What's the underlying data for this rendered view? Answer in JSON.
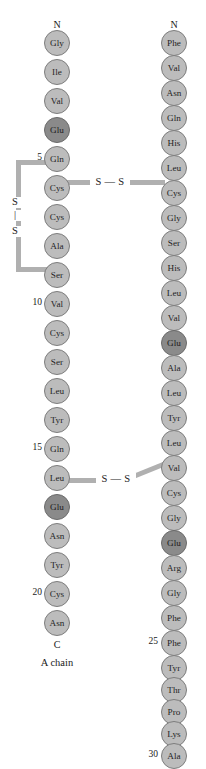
{
  "figure": {
    "colors": {
      "residue_fill": "#bcbcbc",
      "residue_fill_dark": "#8a8a8a",
      "residue_stroke": "#7d7d7d",
      "bond": "#b0b0b0",
      "text": "#1a1a1a",
      "background": "#ffffff"
    }
  },
  "chains": [
    {
      "id": "a-chain",
      "name": "A chain",
      "n_terminus_label": "N",
      "c_terminus_label": "C",
      "residues": [
        {
          "pos": 1,
          "label": "Gly",
          "shade": "light"
        },
        {
          "pos": 2,
          "label": "Ile",
          "shade": "light"
        },
        {
          "pos": 3,
          "label": "Val",
          "shade": "light"
        },
        {
          "pos": 4,
          "label": "Glu",
          "shade": "dark"
        },
        {
          "pos": 5,
          "label": "Gln",
          "shade": "light"
        },
        {
          "pos": 6,
          "label": "Cys",
          "shade": "light"
        },
        {
          "pos": 7,
          "label": "Cys",
          "shade": "light"
        },
        {
          "pos": 8,
          "label": "Ala",
          "shade": "light"
        },
        {
          "pos": 9,
          "label": "Ser",
          "shade": "light"
        },
        {
          "pos": 10,
          "label": "Val",
          "shade": "light"
        },
        {
          "pos": 11,
          "label": "Cys",
          "shade": "light"
        },
        {
          "pos": 12,
          "label": "Ser",
          "shade": "light"
        },
        {
          "pos": 13,
          "label": "Leu",
          "shade": "light"
        },
        {
          "pos": 14,
          "label": "Tyr",
          "shade": "light"
        },
        {
          "pos": 15,
          "label": "Gln",
          "shade": "light"
        },
        {
          "pos": 16,
          "label": "Leu",
          "shade": "light"
        },
        {
          "pos": 17,
          "label": "Glu",
          "shade": "dark"
        },
        {
          "pos": 18,
          "label": "Asn",
          "shade": "light"
        },
        {
          "pos": 19,
          "label": "Tyr",
          "shade": "light"
        },
        {
          "pos": 20,
          "label": "Cys",
          "shade": "light"
        },
        {
          "pos": 21,
          "label": "Asn",
          "shade": "light"
        }
      ],
      "number_ticks": [
        "5",
        "10",
        "15",
        "20"
      ]
    },
    {
      "id": "b-chain",
      "name": "B chain",
      "n_terminus_label": "N",
      "c_terminus_label": "C",
      "residues": [
        {
          "pos": 1,
          "label": "Phe",
          "shade": "light"
        },
        {
          "pos": 2,
          "label": "Val",
          "shade": "light"
        },
        {
          "pos": 3,
          "label": "Asn",
          "shade": "light"
        },
        {
          "pos": 4,
          "label": "Gln",
          "shade": "light"
        },
        {
          "pos": 5,
          "label": "His",
          "shade": "light"
        },
        {
          "pos": 6,
          "label": "Leu",
          "shade": "light"
        },
        {
          "pos": 7,
          "label": "Cys",
          "shade": "light"
        },
        {
          "pos": 8,
          "label": "Gly",
          "shade": "light"
        },
        {
          "pos": 9,
          "label": "Ser",
          "shade": "light"
        },
        {
          "pos": 10,
          "label": "His",
          "shade": "light"
        },
        {
          "pos": 11,
          "label": "Leu",
          "shade": "light"
        },
        {
          "pos": 12,
          "label": "Val",
          "shade": "light"
        },
        {
          "pos": 13,
          "label": "Glu",
          "shade": "dark"
        },
        {
          "pos": 14,
          "label": "Ala",
          "shade": "light"
        },
        {
          "pos": 15,
          "label": "Leu",
          "shade": "light"
        },
        {
          "pos": 16,
          "label": "Tyr",
          "shade": "light"
        },
        {
          "pos": 17,
          "label": "Leu",
          "shade": "light"
        },
        {
          "pos": 18,
          "label": "Val",
          "shade": "light"
        },
        {
          "pos": 19,
          "label": "Cys",
          "shade": "light"
        },
        {
          "pos": 20,
          "label": "Gly",
          "shade": "light"
        },
        {
          "pos": 21,
          "label": "Glu",
          "shade": "dark"
        },
        {
          "pos": 22,
          "label": "Arg",
          "shade": "light"
        },
        {
          "pos": 23,
          "label": "Gly",
          "shade": "light"
        },
        {
          "pos": 24,
          "label": "Phe",
          "shade": "light"
        },
        {
          "pos": 25,
          "label": "Phe",
          "shade": "light"
        },
        {
          "pos": 26,
          "label": "Tyr",
          "shade": "light"
        },
        {
          "pos": 27,
          "label": "Thr",
          "shade": "light"
        },
        {
          "pos": 28,
          "label": "Pro",
          "shade": "light"
        },
        {
          "pos": 29,
          "label": "Lys",
          "shade": "light"
        },
        {
          "pos": 30,
          "label": "Ala",
          "shade": "light"
        }
      ],
      "number_ticks": [
        "25",
        "30"
      ]
    }
  ],
  "disulfide_bonds": [
    {
      "id": "intrachain-a6-a11",
      "label_top": "S",
      "label_bottom": "S",
      "separator": "|",
      "from": "A6",
      "to": "A11"
    },
    {
      "id": "interchain-a7-b7",
      "label": "S — S",
      "from": "A7",
      "to": "B7"
    },
    {
      "id": "interchain-a20-b19",
      "label": "S — S",
      "from": "A20",
      "to": "B19"
    }
  ]
}
